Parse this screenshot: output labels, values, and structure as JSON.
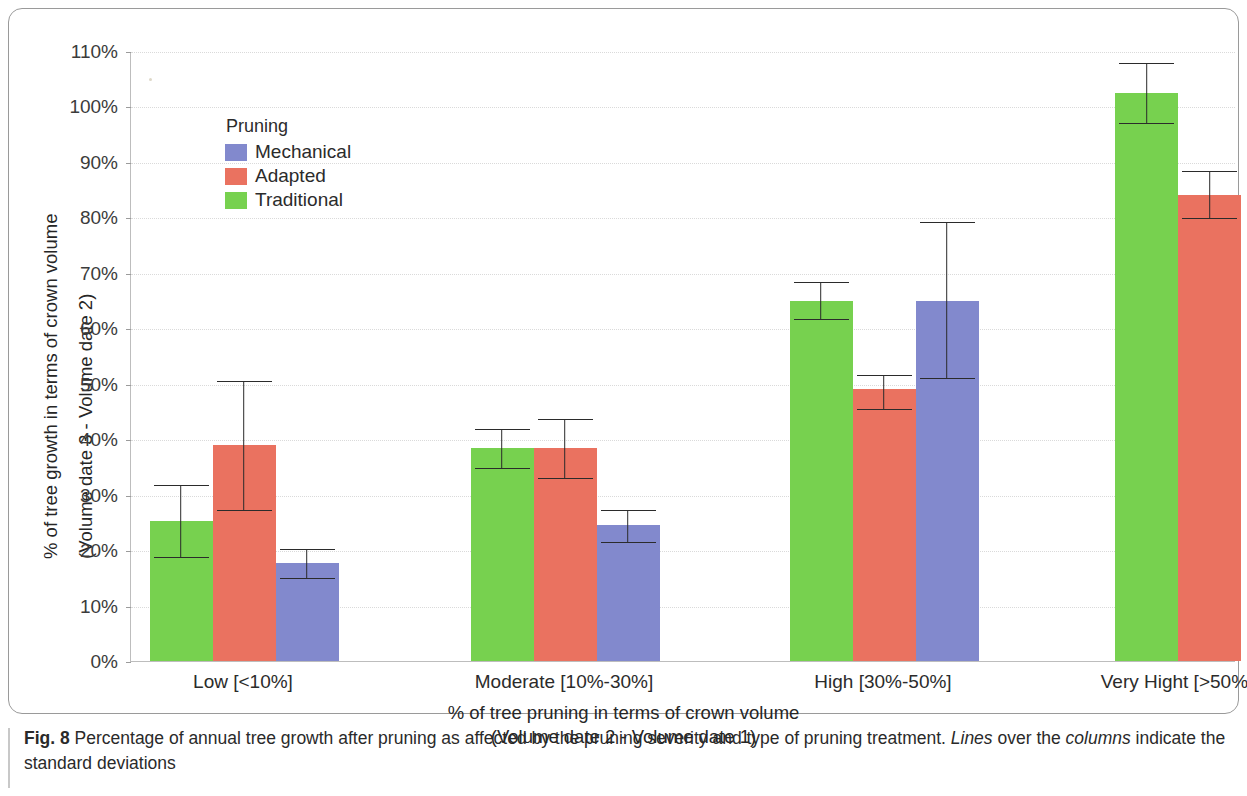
{
  "figure": {
    "caption_number": "Fig. 8",
    "caption_text_1": " Percentage of annual tree growth after pruning as affected by the pruning severity and type of pruning treatment. ",
    "caption_italic_1": "Lines",
    "caption_text_2": " over the ",
    "caption_italic_2": "columns",
    "caption_text_3": " indicate the standard deviations"
  },
  "legend": {
    "title": "Pruning",
    "items": [
      {
        "label": "Mechanical",
        "color": "#8289cd"
      },
      {
        "label": "Adapted",
        "color": "#ea7260"
      },
      {
        "label": "Traditional",
        "color": "#77d14f"
      }
    ]
  },
  "axes": {
    "y_title_line1": "% of tree growth in terms of crown volume",
    "y_title_line2": "(Volume date 3 - Volume date 2)",
    "x_title_line1": "% of tree pruning in terms of crown volume",
    "x_title_line2": "(Volume date 2 - Volume date 1)",
    "y_tick_labels": [
      "0%",
      "10%",
      "20%",
      "30%",
      "40%",
      "50%",
      "60%",
      "70%",
      "80%",
      "90%",
      "100%",
      "110%"
    ]
  },
  "chart_data": {
    "type": "bar",
    "title": "",
    "xlabel": "% of tree pruning in terms of crown volume (Volume date 2 - Volume date 1)",
    "ylabel": "% of tree growth in terms of crown volume (Volume date 3 - Volume date 2)",
    "ylim": [
      0,
      110
    ],
    "ytick_step": 10,
    "grid": true,
    "legend_position": "upper-left-inside",
    "units": "percent",
    "categories": [
      "Low [<10%]",
      "Moderate [10%-30%]",
      "High [30%-50%]",
      "Very Hight [>50%]"
    ],
    "series": [
      {
        "name": "Traditional",
        "color": "#77d14f",
        "values": [
          25.3,
          38.5,
          65.0,
          102.5
        ],
        "err_low": [
          18.7,
          34.8,
          61.7,
          97.0
        ],
        "err_high": [
          32.0,
          42.0,
          68.5,
          108.0
        ]
      },
      {
        "name": "Adapted",
        "color": "#ea7260",
        "values": [
          39.0,
          38.5,
          49.0,
          84.0
        ],
        "err_low": [
          27.3,
          33.0,
          45.5,
          79.8
        ],
        "err_high": [
          50.6,
          43.8,
          51.8,
          88.5
        ]
      },
      {
        "name": "Mechanical",
        "color": "#8289cd",
        "values": [
          17.7,
          24.5,
          65.0,
          null
        ],
        "err_low": [
          15.0,
          21.5,
          51.0,
          null
        ],
        "err_high": [
          20.3,
          27.5,
          79.3,
          null
        ]
      }
    ],
    "series_draw_order": [
      "Traditional",
      "Adapted",
      "Mechanical"
    ]
  }
}
